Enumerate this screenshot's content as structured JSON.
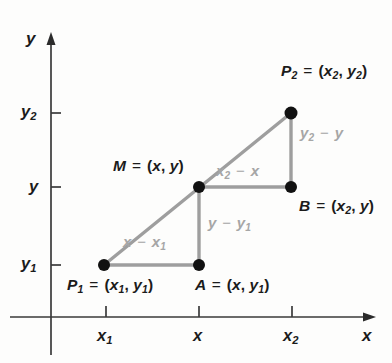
{
  "figure": {
    "background_color": "#fdfdfc",
    "axis_color": "#2b2b2b",
    "segment_color": "#9e9e9e",
    "point_color": "#111111",
    "label_color": "#1b1b1b",
    "segment_label_color": "#a6a6a6"
  },
  "axes": {
    "x_axis_label": "x",
    "y_axis_label": "y",
    "x_ticks": [
      {
        "label_html": "x<sub>1</sub>",
        "value": "x_1",
        "px": 106
      },
      {
        "label_html": "x",
        "value": "x",
        "px": 199
      },
      {
        "label_html": "x<sub>2</sub>",
        "value": "x_2",
        "px": 292
      }
    ],
    "y_ticks": [
      {
        "label_html": "y<sub>2</sub>",
        "value": "y_2",
        "px": 113
      },
      {
        "label_html": "y",
        "value": "y",
        "px": 187
      },
      {
        "label_html": "y<sub>1</sub>",
        "value": "y_1",
        "px": 265
      }
    ]
  },
  "points": [
    {
      "name": "P1",
      "label_html": "P<sub>1</sub> <span class=\"op\">=</span> <span class=\"paren\">(</span>x<sub>1</sub><span class=\"comma\">,</span> y<sub>1</sub><span class=\"paren\">)</span>",
      "coords": "(x_1, y_1)",
      "cx": 104,
      "cy": 265
    },
    {
      "name": "A",
      "label_html": "A <span class=\"op\">=</span> <span class=\"paren\">(</span>x<span class=\"comma\">,</span> y<sub>1</sub><span class=\"paren\">)</span>",
      "coords": "(x, y_1)",
      "cx": 199,
      "cy": 265
    },
    {
      "name": "M",
      "label_html": "M <span class=\"op\">=</span> <span class=\"paren\">(</span>x<span class=\"comma\">,</span> y<span class=\"paren\">)</span>",
      "coords": "(x, y)",
      "cx": 199,
      "cy": 187
    },
    {
      "name": "B",
      "label_html": "B <span class=\"op\">=</span> <span class=\"paren\">(</span>x<sub>2</sub><span class=\"comma\">,</span> y<span class=\"paren\">)</span>",
      "coords": "(x_2, y)",
      "cx": 291,
      "cy": 187
    },
    {
      "name": "P2",
      "label_html": "P<sub>2</sub> <span class=\"op\">=</span> <span class=\"paren\">(</span>x<sub>2</sub><span class=\"comma\">,</span> y<sub>2</sub><span class=\"paren\">)</span>",
      "coords": "(x_2, y_2)",
      "cx": 291,
      "cy": 113
    }
  ],
  "segment_labels": [
    {
      "name": "x-minus-x1",
      "html": "x <span class=\"op\">&minus;</span> x<sub>1</sub>",
      "text": "x - x_1"
    },
    {
      "name": "y-minus-y1",
      "html": "y <span class=\"op\">&minus;</span> y<sub>1</sub>",
      "text": "y - y_1"
    },
    {
      "name": "x2-minus-x",
      "html": "x<sub>2</sub> <span class=\"op\">&minus;</span> x",
      "text": "x_2 - x"
    },
    {
      "name": "y2-minus-y",
      "html": "y<sub>2</sub> <span class=\"op\">&minus;</span> y",
      "text": "y_2 - y"
    }
  ],
  "chart_data": {
    "type": "scatter",
    "xlabel": "x",
    "ylabel": "y",
    "grid": false,
    "legend": "none",
    "x_tick_labels": [
      "x_1",
      "x",
      "x_2"
    ],
    "y_tick_labels": [
      "y_1",
      "y",
      "y_2"
    ],
    "points": [
      {
        "name": "P_1",
        "x": "x_1",
        "y": "y_1",
        "px": 104,
        "py": 265
      },
      {
        "name": "A",
        "x": "x",
        "y": "y_1",
        "px": 199,
        "py": 265
      },
      {
        "name": "M",
        "x": "x",
        "y": "y",
        "px": 199,
        "py": 187
      },
      {
        "name": "B",
        "x": "x_2",
        "y": "y",
        "px": 291,
        "py": 187
      },
      {
        "name": "P_2",
        "x": "x_2",
        "y": "y_2",
        "px": 291,
        "py": 113
      }
    ],
    "segments": [
      {
        "from": "P_1",
        "to": "P_2",
        "kind": "hypotenuse",
        "label": ""
      },
      {
        "from": "P_1",
        "to": "A",
        "kind": "leg",
        "label": "x - x_1"
      },
      {
        "from": "A",
        "to": "M",
        "kind": "leg",
        "label": "y - y_1"
      },
      {
        "from": "M",
        "to": "B",
        "kind": "leg",
        "label": "x_2 - x"
      },
      {
        "from": "B",
        "to": "P_2",
        "kind": "leg",
        "label": "y_2 - y"
      }
    ],
    "annotations": [
      "P_1 = (x_1, y_1)",
      "A = (x, y_1)",
      "M = (x, y)",
      "B = (x_2, y)",
      "P_2 = (x_2, y_2)"
    ]
  }
}
